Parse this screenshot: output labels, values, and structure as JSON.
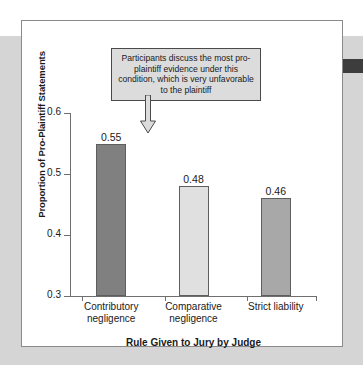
{
  "figure": {
    "annotation": "Participants discuss the most pro-plaintiff evidence under this condition, which is very unfavorable to the plaintiff",
    "arrow_icon": "down-arrow-icon",
    "tab_marker": "page-tab-marker"
  },
  "chart_data": {
    "type": "bar",
    "title": "",
    "categories": [
      "Contributory negligence",
      "Comparative negligence",
      "Strict liability"
    ],
    "category_lines": [
      [
        "Contributory",
        "negligence"
      ],
      [
        "Comparative",
        "negligence"
      ],
      [
        "Strict liability",
        ""
      ]
    ],
    "values": [
      0.55,
      0.48,
      0.46
    ],
    "value_labels": [
      "0.55",
      "0.48",
      "0.46"
    ],
    "bar_colors": [
      "#808080",
      "#e0e0e0",
      "#a8a8a8"
    ],
    "xlabel": "Rule Given to Jury by Judge",
    "ylabel": "Proportion of Pro-Plaintiff Statements",
    "ylim": [
      0.3,
      0.6
    ],
    "yticks": [
      0.3,
      0.4,
      0.5,
      0.6
    ],
    "ytick_labels": [
      "0.3",
      "0.4",
      "0.5",
      "0.6"
    ],
    "grid": false,
    "legend": false
  }
}
